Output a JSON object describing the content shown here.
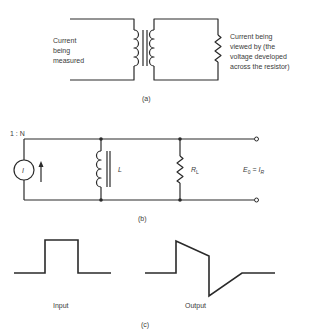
{
  "figure": {
    "part_a": {
      "caption": "(a)",
      "left_label": [
        "Current",
        "being",
        "measured"
      ],
      "right_label": [
        "Current being",
        "viewed by (the",
        "voltage developed",
        "across the resistor)"
      ]
    },
    "part_b": {
      "caption": "(b)",
      "ratio_label": "1 : N",
      "source_label": "I",
      "inductor_label": "L",
      "resistor_label": "R",
      "resistor_subscript": "L",
      "output_eq_lhs": "E",
      "output_eq_lhs_sub": "0",
      "output_eq_op": " = ",
      "output_eq_rhs": "I",
      "output_eq_rhs_sub": "R"
    },
    "part_c": {
      "caption": "(c)",
      "input_label": "Input",
      "output_label": "Output"
    }
  }
}
